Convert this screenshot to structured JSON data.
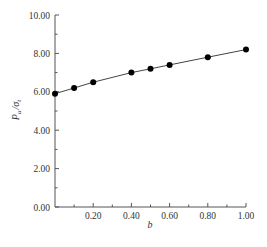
{
  "chart_data": {
    "type": "line",
    "title": "",
    "xlabel": "b",
    "ylabel": "P_u / σ_t",
    "ylabel_parts": {
      "main": "P",
      "sub1": "u",
      "sep": "/",
      "sigma": "σ",
      "sub2": "t"
    },
    "x": [
      0.0,
      0.1,
      0.2,
      0.4,
      0.5,
      0.6,
      0.8,
      1.0
    ],
    "series": [
      {
        "name": "P_u/σ_t",
        "values": [
          5.9,
          6.2,
          6.5,
          7.0,
          7.2,
          7.4,
          7.8,
          8.2
        ],
        "marker": "filled-circle",
        "color": "#000000"
      }
    ],
    "xlim": [
      0,
      1.0
    ],
    "ylim": [
      0,
      10
    ],
    "x_ticks": [
      0.2,
      0.4,
      0.6,
      0.8,
      1.0
    ],
    "x_tick_labels": [
      "0.20",
      "0.40",
      "0.60",
      "0.80",
      "1.00"
    ],
    "x_minor_ticks": [
      0.1,
      0.3,
      0.5,
      0.7,
      0.9
    ],
    "y_ticks": [
      0,
      2,
      4,
      6,
      8,
      10
    ],
    "y_tick_labels": [
      "0.00",
      "2.00",
      "4.00",
      "6.00",
      "8.00",
      "10.00"
    ],
    "y_minor_ticks": [
      1,
      3,
      5,
      7,
      9
    ],
    "grid": false,
    "legend": "none"
  },
  "colors": {
    "axis": "#555555",
    "line": "#444444",
    "marker": "#000000",
    "text": "#333333"
  }
}
